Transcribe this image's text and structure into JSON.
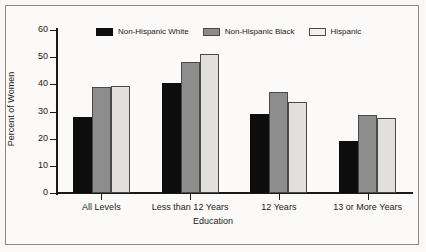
{
  "chart_data": {
    "type": "bar",
    "title": "",
    "xlabel": "Education",
    "ylabel": "Percent of Women",
    "ylim": [
      0,
      60
    ],
    "yticks": [
      0,
      10,
      20,
      30,
      40,
      50,
      60
    ],
    "grid": false,
    "legend_position": "top-center",
    "categories": [
      "All Levels",
      "Less than 12 Years",
      "12 Years",
      "13 or More Years"
    ],
    "series": [
      {
        "name": "Non-Hispanic White",
        "color": "#0d0d0d",
        "values": [
          27.8,
          40.4,
          29.1,
          19.3
        ]
      },
      {
        "name": "Non-Hispanic Black",
        "color": "#8d8d8d",
        "values": [
          39.0,
          48.4,
          37.2,
          28.7
        ]
      },
      {
        "name": "Hispanic",
        "color": "#e2e0dd",
        "values": [
          39.4,
          51.1,
          33.4,
          27.6
        ]
      }
    ]
  },
  "axes": {
    "y_title": "Percent of Women",
    "x_title": "Education",
    "y_tick_labels": [
      "0",
      "10",
      "20",
      "30",
      "40",
      "50",
      "60"
    ],
    "x_tick_labels": [
      "All Levels",
      "Less than 12 Years",
      "12 Years",
      "13 or More Years"
    ]
  },
  "legend": {
    "items": [
      {
        "label": "Non-Hispanic White"
      },
      {
        "label": "Non-Hispanic Black"
      },
      {
        "label": "Hispanic"
      }
    ]
  }
}
